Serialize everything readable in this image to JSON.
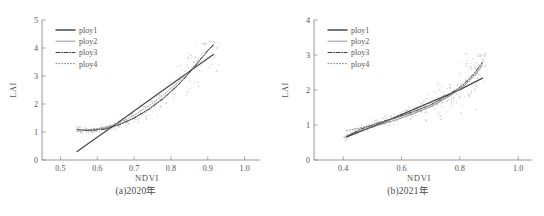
{
  "figure": {
    "panels": [
      {
        "id": "a",
        "caption": "(a)2020年",
        "chart_data": {
          "type": "scatter",
          "title": "(a)2020年",
          "xlabel": "NDVI",
          "ylabel": "LAI",
          "xlim": [
            0.45,
            1.02
          ],
          "ylim": [
            0,
            5
          ],
          "xticks": [
            0.5,
            0.6,
            0.7,
            0.8,
            0.9,
            1.0
          ],
          "xticklabels": [
            "0.5",
            "0.6",
            "0.7",
            "0.8",
            "0.9",
            "1.0"
          ],
          "yticks": [
            0,
            1,
            2,
            3,
            4,
            5
          ],
          "yticklabels": [
            "0",
            "1",
            "2",
            "3",
            "4",
            "5"
          ],
          "grid": false,
          "legend_position": "upper-left",
          "legend": [
            "ploy1",
            "ploy2",
            "ploy3",
            "ploy4"
          ],
          "series": [
            {
              "name": "ploy1",
              "style": "solid-thick",
              "color": "#4a4a4a",
              "x": [
                0.545,
                0.65,
                0.75,
                0.85,
                0.915
              ],
              "y": [
                0.3,
                1.28,
                2.22,
                3.16,
                3.77
              ]
            },
            {
              "name": "ploy2",
              "style": "solid-thin",
              "color": "#6b6b6b",
              "x": [
                0.545,
                0.58,
                0.62,
                0.66,
                0.7,
                0.74,
                0.78,
                0.82,
                0.86,
                0.9,
                0.915
              ],
              "y": [
                1.03,
                1.07,
                1.13,
                1.27,
                1.5,
                1.82,
                2.22,
                2.7,
                3.26,
                3.9,
                4.1
              ]
            },
            {
              "name": "ploy3",
              "style": "dash-dot",
              "color": "#3c3c3c",
              "x": [
                0.545,
                0.58,
                0.62,
                0.66,
                0.7,
                0.74,
                0.78,
                0.82,
                0.86,
                0.9,
                0.915
              ],
              "y": [
                1.1,
                1.05,
                1.1,
                1.26,
                1.5,
                1.81,
                2.2,
                2.68,
                3.26,
                3.92,
                4.12
              ]
            },
            {
              "name": "ploy4",
              "style": "dotted",
              "color": "#8a8a8a",
              "x": [
                0.545,
                0.58,
                0.62,
                0.66,
                0.7,
                0.74,
                0.78,
                0.82,
                0.86,
                0.9,
                0.915
              ],
              "y": [
                1.08,
                1.09,
                1.16,
                1.33,
                1.6,
                1.93,
                2.33,
                2.79,
                3.31,
                3.9,
                4.08
              ]
            }
          ],
          "scatter": {
            "name": "observations",
            "color": "#b9b9b9",
            "n": 260,
            "x_range": [
              0.54,
              0.93
            ],
            "y_range": [
              0.85,
              4.25
            ],
            "description": "grey point cloud following an upward curving trend, densest between NDVI 0.55-0.70 near LAI 1 and widening near NDVI 0.90"
          }
        }
      },
      {
        "id": "b",
        "caption": "(b)2021年",
        "chart_data": {
          "type": "scatter",
          "title": "(b)2021年",
          "xlabel": "NDVI",
          "ylabel": "LAI",
          "xlim": [
            0.3,
            1.02
          ],
          "ylim": [
            0,
            4
          ],
          "xticks": [
            0.4,
            0.6,
            0.8,
            1.0
          ],
          "xticklabels": [
            "0.4",
            "0.6",
            "0.8",
            "1.0"
          ],
          "yticks": [
            0,
            1,
            2,
            3,
            4
          ],
          "yticklabels": [
            "0",
            "1",
            "2",
            "3",
            "4"
          ],
          "grid": false,
          "legend_position": "upper-left",
          "legend": [
            "ploy1",
            "ploy2",
            "ploy3",
            "ploy4"
          ],
          "series": [
            {
              "name": "ploy1",
              "style": "solid-thick",
              "color": "#4a4a4a",
              "x": [
                0.412,
                0.55,
                0.68,
                0.8,
                0.878
              ],
              "y": [
                0.66,
                1.12,
                1.58,
                2.01,
                2.34
              ]
            },
            {
              "name": "ploy2",
              "style": "solid-thin",
              "color": "#6b6b6b",
              "x": [
                0.412,
                0.46,
                0.52,
                0.58,
                0.64,
                0.7,
                0.76,
                0.81,
                0.85,
                0.878
              ],
              "y": [
                0.7,
                0.83,
                0.99,
                1.14,
                1.32,
                1.52,
                1.8,
                2.08,
                2.4,
                2.7
              ]
            },
            {
              "name": "ploy3",
              "style": "dash-dot",
              "color": "#3c3c3c",
              "x": [
                0.412,
                0.46,
                0.52,
                0.58,
                0.64,
                0.7,
                0.76,
                0.81,
                0.85,
                0.878
              ],
              "y": [
                0.66,
                0.88,
                1.06,
                1.21,
                1.38,
                1.58,
                1.85,
                2.14,
                2.48,
                2.8
              ]
            },
            {
              "name": "ploy4",
              "style": "dotted",
              "color": "#8a8a8a",
              "x": [
                0.412,
                0.46,
                0.52,
                0.58,
                0.64,
                0.7,
                0.76,
                0.81,
                0.85,
                0.878
              ],
              "y": [
                0.84,
                0.92,
                1.05,
                1.19,
                1.35,
                1.55,
                1.82,
                2.1,
                2.44,
                2.76
              ]
            }
          ],
          "scatter": {
            "name": "observations",
            "color": "#b9b9b9",
            "n": 300,
            "x_range": [
              0.4,
              0.89
            ],
            "y_range": [
              0.45,
              3.05
            ],
            "description": "grey point cloud following the fitted curves, fanning out strongly above NDVI 0.80 between LAI 1.8 and 3.0"
          }
        }
      }
    ]
  }
}
